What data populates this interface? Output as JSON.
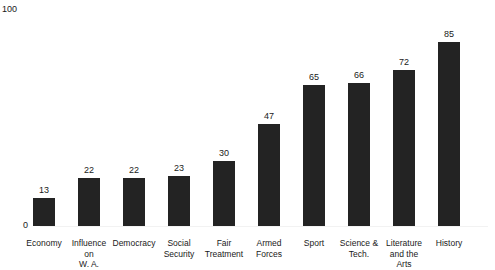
{
  "chart_data": {
    "type": "bar",
    "title": "",
    "xlabel": "",
    "ylabel": "",
    "ylim": [
      0,
      100
    ],
    "grid": false,
    "legend": null,
    "y_ticks": [
      "0",
      "100"
    ],
    "categories": [
      "Economy",
      "Influence on W. A.",
      "Democracy",
      "Social Security",
      "Fair Treatment",
      "Armed Forces",
      "Sport",
      "Science & Tech.",
      "Literature and the Arts",
      "History"
    ],
    "category_lines": [
      [
        "Economy"
      ],
      [
        "Influence on",
        "W. A."
      ],
      [
        "Democracy"
      ],
      [
        "Social",
        "Security"
      ],
      [
        "Fair",
        "Treatment"
      ],
      [
        "Armed",
        "Forces"
      ],
      [
        "Sport"
      ],
      [
        "Science &",
        "Tech."
      ],
      [
        "Literature",
        "and the Arts"
      ],
      [
        "History"
      ]
    ],
    "values": [
      13,
      22,
      22,
      23,
      30,
      47,
      65,
      66,
      72,
      85
    ],
    "value_labels": [
      "13",
      "22",
      "22",
      "23",
      "30",
      "47",
      "65",
      "66",
      "72",
      "85"
    ],
    "bar_color": "#232323",
    "background_color": "#ffffff",
    "text_color": "#1a1a1a"
  }
}
